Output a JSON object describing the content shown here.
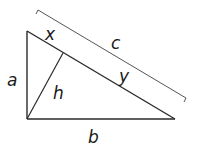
{
  "diagram": {
    "type": "right-triangle-with-altitude",
    "labels": {
      "a": "a",
      "b": "b",
      "c": "c",
      "h": "h",
      "x": "x",
      "y": "y"
    },
    "colors": {
      "stroke": "#2a2a2a",
      "bracket": "#555555",
      "text": "#1a1a1a",
      "background": "#ffffff"
    },
    "vertices": {
      "top": [
        27,
        31
      ],
      "bottom_left": [
        27,
        119
      ],
      "bottom_right": [
        175,
        119
      ],
      "altitude_foot": [
        63,
        54
      ]
    }
  }
}
